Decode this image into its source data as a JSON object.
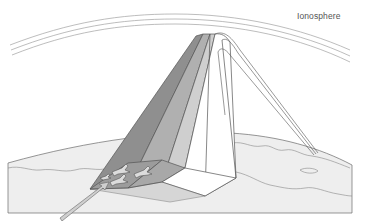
{
  "diagram": {
    "labels": {
      "ionosphere": "Ionosphere"
    },
    "colors": {
      "background": "#ffffff",
      "line": "#555555",
      "arc": "#9a9a9a",
      "ground_fill": "#eeeeee",
      "beam_dark": "#8f8f8f",
      "beam_mid": "#b0b0b0",
      "beam_light": "#cfcfcf",
      "beam_white": "#ffffff",
      "footprint_dark": "#9c9c9c",
      "footprint_light": "#c4c4c4",
      "arrow_fill": "#cfcfcf"
    },
    "elements": [
      {
        "name": "ionosphere-layer",
        "description": "three concentric curved lines across top"
      },
      {
        "name": "ground-slab",
        "description": "curved earth surface with coastline outlines"
      },
      {
        "name": "radar-beam",
        "description": "shaded pyramid rising from footprint to ionosphere apex"
      },
      {
        "name": "reflected-beam",
        "description": "thin double-line beam descending to right side of ground"
      },
      {
        "name": "aircraft-group",
        "description": "four aircraft silhouettes in illuminated footprint"
      },
      {
        "name": "incoming-arrow",
        "description": "arrow pointing toward footprint from lower left"
      }
    ]
  }
}
